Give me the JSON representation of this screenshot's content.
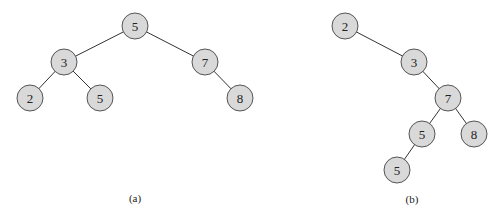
{
  "diagram": {
    "node_color": "#d9d9d9",
    "node_radius": 13,
    "trees": [
      {
        "id": "a",
        "caption": "(a)",
        "caption_pos": [
          135,
          198
        ],
        "nodes": [
          {
            "id": "a1",
            "label": "5",
            "x": 135,
            "y": 26
          },
          {
            "id": "a2",
            "label": "3",
            "x": 64,
            "y": 62
          },
          {
            "id": "a3",
            "label": "7",
            "x": 205,
            "y": 62
          },
          {
            "id": "a4",
            "label": "2",
            "x": 30,
            "y": 98
          },
          {
            "id": "a5",
            "label": "5",
            "x": 100,
            "y": 98
          },
          {
            "id": "a6",
            "label": "8",
            "x": 240,
            "y": 98
          }
        ],
        "edges": [
          [
            "a1",
            "a2"
          ],
          [
            "a1",
            "a3"
          ],
          [
            "a2",
            "a4"
          ],
          [
            "a2",
            "a5"
          ],
          [
            "a3",
            "a6"
          ]
        ]
      },
      {
        "id": "b",
        "caption": "(b)",
        "caption_pos": [
          412,
          199
        ],
        "nodes": [
          {
            "id": "b1",
            "label": "2",
            "x": 345,
            "y": 26
          },
          {
            "id": "b2",
            "label": "3",
            "x": 414,
            "y": 62
          },
          {
            "id": "b3",
            "label": "7",
            "x": 448,
            "y": 98
          },
          {
            "id": "b4",
            "label": "5",
            "x": 422,
            "y": 134
          },
          {
            "id": "b5",
            "label": "8",
            "x": 474,
            "y": 134
          },
          {
            "id": "b6",
            "label": "5",
            "x": 397,
            "y": 170
          }
        ],
        "edges": [
          [
            "b1",
            "b2"
          ],
          [
            "b2",
            "b3"
          ],
          [
            "b3",
            "b4"
          ],
          [
            "b3",
            "b5"
          ],
          [
            "b4",
            "b6"
          ]
        ]
      }
    ]
  }
}
